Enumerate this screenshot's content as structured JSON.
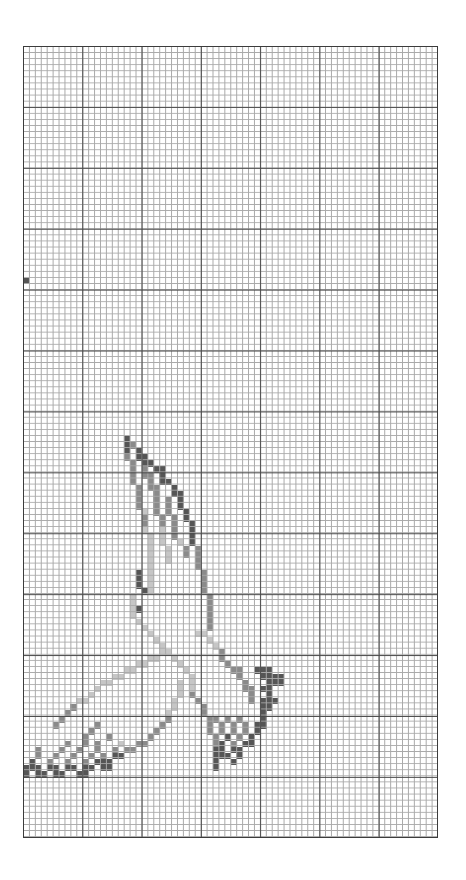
{
  "pattern": {
    "columns": 70,
    "rows": 130,
    "major_every": 10,
    "colors": {
      "d": "#555555",
      "m": "#8a8a8a",
      "l": "#c6c6c6",
      "minor_line": "#a9a9a9",
      "major_line": "#4a4a4a"
    },
    "subject": "bird-in-flight",
    "cells": [
      [
        0,
        38,
        "d"
      ],
      [
        17,
        64,
        "d"
      ],
      [
        17,
        65,
        "d"
      ],
      [
        18,
        65,
        "m"
      ],
      [
        17,
        66,
        "d"
      ],
      [
        19,
        66,
        "d"
      ],
      [
        17,
        67,
        "m"
      ],
      [
        19,
        67,
        "d"
      ],
      [
        20,
        67,
        "d"
      ],
      [
        18,
        68,
        "m"
      ],
      [
        20,
        68,
        "d"
      ],
      [
        21,
        68,
        "d"
      ],
      [
        18,
        69,
        "m"
      ],
      [
        20,
        69,
        "m"
      ],
      [
        22,
        69,
        "d"
      ],
      [
        23,
        69,
        "d"
      ],
      [
        18,
        70,
        "m"
      ],
      [
        20,
        70,
        "m"
      ],
      [
        21,
        70,
        "m"
      ],
      [
        23,
        70,
        "d"
      ],
      [
        18,
        71,
        "m"
      ],
      [
        21,
        71,
        "m"
      ],
      [
        23,
        71,
        "d"
      ],
      [
        24,
        71,
        "d"
      ],
      [
        19,
        72,
        "m"
      ],
      [
        21,
        72,
        "m"
      ],
      [
        22,
        72,
        "m"
      ],
      [
        25,
        72,
        "d"
      ],
      [
        19,
        73,
        "m"
      ],
      [
        22,
        73,
        "m"
      ],
      [
        25,
        73,
        "d"
      ],
      [
        26,
        73,
        "d"
      ],
      [
        19,
        74,
        "m"
      ],
      [
        22,
        74,
        "m"
      ],
      [
        24,
        74,
        "m"
      ],
      [
        26,
        74,
        "d"
      ],
      [
        19,
        75,
        "m"
      ],
      [
        22,
        75,
        "m"
      ],
      [
        24,
        75,
        "m"
      ],
      [
        26,
        75,
        "d"
      ],
      [
        20,
        76,
        "l"
      ],
      [
        22,
        76,
        "m"
      ],
      [
        24,
        76,
        "m"
      ],
      [
        27,
        76,
        "d"
      ],
      [
        20,
        77,
        "m"
      ],
      [
        23,
        77,
        "m"
      ],
      [
        25,
        77,
        "m"
      ],
      [
        27,
        77,
        "d"
      ],
      [
        20,
        78,
        "m"
      ],
      [
        23,
        78,
        "m"
      ],
      [
        25,
        78,
        "m"
      ],
      [
        28,
        78,
        "d"
      ],
      [
        20,
        79,
        "l"
      ],
      [
        23,
        79,
        "l"
      ],
      [
        25,
        79,
        "m"
      ],
      [
        28,
        79,
        "d"
      ],
      [
        21,
        80,
        "l"
      ],
      [
        23,
        80,
        "l"
      ],
      [
        25,
        80,
        "m"
      ],
      [
        28,
        80,
        "d"
      ],
      [
        21,
        81,
        "l"
      ],
      [
        23,
        81,
        "l"
      ],
      [
        26,
        81,
        "l"
      ],
      [
        28,
        81,
        "d"
      ],
      [
        21,
        82,
        "l"
      ],
      [
        24,
        82,
        "l"
      ],
      [
        27,
        82,
        "m"
      ],
      [
        29,
        82,
        "m"
      ],
      [
        21,
        83,
        "l"
      ],
      [
        24,
        83,
        "l"
      ],
      [
        27,
        83,
        "m"
      ],
      [
        29,
        83,
        "m"
      ],
      [
        21,
        84,
        "l"
      ],
      [
        24,
        84,
        "l"
      ],
      [
        29,
        84,
        "m"
      ],
      [
        21,
        85,
        "l"
      ],
      [
        29,
        85,
        "m"
      ],
      [
        19,
        86,
        "d"
      ],
      [
        21,
        86,
        "l"
      ],
      [
        30,
        86,
        "m"
      ],
      [
        19,
        87,
        "d"
      ],
      [
        21,
        87,
        "l"
      ],
      [
        30,
        87,
        "m"
      ],
      [
        19,
        88,
        "d"
      ],
      [
        21,
        88,
        "l"
      ],
      [
        30,
        88,
        "m"
      ],
      [
        20,
        89,
        "d"
      ],
      [
        21,
        89,
        "l"
      ],
      [
        30,
        89,
        "m"
      ],
      [
        18,
        90,
        "l"
      ],
      [
        31,
        90,
        "m"
      ],
      [
        18,
        91,
        "l"
      ],
      [
        31,
        91,
        "m"
      ],
      [
        18,
        92,
        "l"
      ],
      [
        19,
        92,
        "d"
      ],
      [
        31,
        92,
        "m"
      ],
      [
        18,
        93,
        "l"
      ],
      [
        31,
        93,
        "m"
      ],
      [
        19,
        94,
        "l"
      ],
      [
        31,
        94,
        "m"
      ],
      [
        20,
        95,
        "l"
      ],
      [
        31,
        95,
        "m"
      ],
      [
        21,
        96,
        "l"
      ],
      [
        29,
        96,
        "l"
      ],
      [
        30,
        96,
        "l"
      ],
      [
        22,
        97,
        "l"
      ],
      [
        23,
        98,
        "l"
      ],
      [
        24,
        99,
        "l"
      ],
      [
        25,
        100,
        "l"
      ],
      [
        26,
        101,
        "l"
      ],
      [
        27,
        102,
        "l"
      ],
      [
        28,
        103,
        "l"
      ],
      [
        28,
        104,
        "l"
      ],
      [
        28,
        105,
        "l"
      ],
      [
        28,
        106,
        "m"
      ],
      [
        29,
        107,
        "m"
      ],
      [
        30,
        108,
        "m"
      ],
      [
        30,
        109,
        "m"
      ],
      [
        31,
        110,
        "m"
      ],
      [
        31,
        111,
        "m"
      ],
      [
        31,
        112,
        "m"
      ],
      [
        31,
        97,
        "l"
      ],
      [
        32,
        98,
        "l"
      ],
      [
        33,
        99,
        "m"
      ],
      [
        33,
        100,
        "m"
      ],
      [
        34,
        101,
        "m"
      ],
      [
        35,
        102,
        "m"
      ],
      [
        36,
        102,
        "m"
      ],
      [
        36,
        103,
        "m"
      ],
      [
        37,
        104,
        "m"
      ],
      [
        37,
        105,
        "m"
      ],
      [
        38,
        105,
        "m"
      ],
      [
        38,
        106,
        "m"
      ],
      [
        38,
        107,
        "m"
      ],
      [
        39,
        102,
        "d"
      ],
      [
        40,
        102,
        "d"
      ],
      [
        41,
        102,
        "d"
      ],
      [
        40,
        103,
        "d"
      ],
      [
        41,
        103,
        "d"
      ],
      [
        42,
        103,
        "d"
      ],
      [
        43,
        103,
        "d"
      ],
      [
        41,
        104,
        "d"
      ],
      [
        42,
        104,
        "d"
      ],
      [
        43,
        104,
        "d"
      ],
      [
        40,
        105,
        "d"
      ],
      [
        41,
        105,
        "d"
      ],
      [
        41,
        106,
        "d"
      ],
      [
        40,
        107,
        "d"
      ],
      [
        41,
        107,
        "d"
      ],
      [
        42,
        107,
        "d"
      ],
      [
        40,
        108,
        "d"
      ],
      [
        41,
        108,
        "d"
      ],
      [
        40,
        109,
        "d"
      ],
      [
        40,
        110,
        "d"
      ],
      [
        39,
        111,
        "d"
      ],
      [
        40,
        111,
        "d"
      ],
      [
        39,
        112,
        "d"
      ],
      [
        38,
        113,
        "d"
      ],
      [
        37,
        114,
        "d"
      ],
      [
        38,
        114,
        "d"
      ],
      [
        36,
        115,
        "d"
      ],
      [
        36,
        116,
        "d"
      ],
      [
        32,
        110,
        "m"
      ],
      [
        34,
        110,
        "m"
      ],
      [
        36,
        110,
        "m"
      ],
      [
        33,
        111,
        "m"
      ],
      [
        35,
        111,
        "m"
      ],
      [
        37,
        111,
        "m"
      ],
      [
        33,
        112,
        "m"
      ],
      [
        35,
        112,
        "m"
      ],
      [
        37,
        112,
        "m"
      ],
      [
        32,
        113,
        "m"
      ],
      [
        34,
        113,
        "d"
      ],
      [
        36,
        113,
        "m"
      ],
      [
        32,
        114,
        "m"
      ],
      [
        33,
        114,
        "d"
      ],
      [
        35,
        114,
        "m"
      ],
      [
        32,
        115,
        "d"
      ],
      [
        33,
        115,
        "d"
      ],
      [
        35,
        115,
        "d"
      ],
      [
        32,
        116,
        "d"
      ],
      [
        33,
        116,
        "d"
      ],
      [
        34,
        116,
        "d"
      ],
      [
        32,
        117,
        "d"
      ],
      [
        35,
        117,
        "d"
      ],
      [
        32,
        118,
        "d"
      ],
      [
        23,
        99,
        "l"
      ],
      [
        22,
        100,
        "l"
      ],
      [
        21,
        100,
        "l"
      ],
      [
        20,
        101,
        "l"
      ],
      [
        19,
        101,
        "l"
      ],
      [
        18,
        102,
        "l"
      ],
      [
        17,
        102,
        "l"
      ],
      [
        16,
        103,
        "l"
      ],
      [
        15,
        103,
        "l"
      ],
      [
        14,
        104,
        "l"
      ],
      [
        13,
        104,
        "l"
      ],
      [
        12,
        105,
        "l"
      ],
      [
        11,
        106,
        "l"
      ],
      [
        10,
        107,
        "l"
      ],
      [
        9,
        107,
        "l"
      ],
      [
        8,
        108,
        "m"
      ],
      [
        7,
        109,
        "m"
      ],
      [
        6,
        110,
        "m"
      ],
      [
        5,
        111,
        "m"
      ],
      [
        26,
        104,
        "l"
      ],
      [
        26,
        105,
        "l"
      ],
      [
        26,
        106,
        "l"
      ],
      [
        25,
        107,
        "l"
      ],
      [
        25,
        108,
        "l"
      ],
      [
        24,
        109,
        "l"
      ],
      [
        24,
        110,
        "m"
      ],
      [
        23,
        111,
        "m"
      ],
      [
        22,
        112,
        "m"
      ],
      [
        21,
        113,
        "m"
      ],
      [
        20,
        114,
        "m"
      ],
      [
        19,
        114,
        "m"
      ],
      [
        18,
        115,
        "m"
      ],
      [
        17,
        115,
        "m"
      ],
      [
        16,
        116,
        "d"
      ],
      [
        15,
        116,
        "d"
      ],
      [
        14,
        117,
        "d"
      ],
      [
        13,
        117,
        "d"
      ],
      [
        12,
        111,
        "m"
      ],
      [
        11,
        112,
        "m"
      ],
      [
        10,
        113,
        "m"
      ],
      [
        14,
        113,
        "m"
      ],
      [
        7,
        114,
        "m"
      ],
      [
        10,
        114,
        "m"
      ],
      [
        12,
        114,
        "m"
      ],
      [
        16,
        114,
        "l"
      ],
      [
        2,
        115,
        "m"
      ],
      [
        6,
        115,
        "m"
      ],
      [
        9,
        115,
        "m"
      ],
      [
        12,
        115,
        "m"
      ],
      [
        15,
        115,
        "m"
      ],
      [
        2,
        116,
        "m"
      ],
      [
        5,
        116,
        "m"
      ],
      [
        8,
        116,
        "m"
      ],
      [
        11,
        116,
        "m"
      ],
      [
        13,
        116,
        "m"
      ],
      [
        1,
        117,
        "d"
      ],
      [
        4,
        117,
        "m"
      ],
      [
        7,
        117,
        "m"
      ],
      [
        10,
        117,
        "m"
      ],
      [
        12,
        117,
        "d"
      ],
      [
        0,
        118,
        "d"
      ],
      [
        1,
        118,
        "d"
      ],
      [
        2,
        118,
        "d"
      ],
      [
        4,
        118,
        "d"
      ],
      [
        5,
        118,
        "d"
      ],
      [
        7,
        118,
        "d"
      ],
      [
        8,
        118,
        "d"
      ],
      [
        10,
        118,
        "d"
      ],
      [
        11,
        118,
        "d"
      ],
      [
        13,
        118,
        "d"
      ],
      [
        14,
        118,
        "d"
      ],
      [
        0,
        119,
        "d"
      ],
      [
        2,
        119,
        "d"
      ],
      [
        3,
        119,
        "d"
      ],
      [
        5,
        119,
        "d"
      ],
      [
        6,
        119,
        "d"
      ],
      [
        9,
        119,
        "d"
      ],
      [
        10,
        119,
        "d"
      ]
    ]
  }
}
